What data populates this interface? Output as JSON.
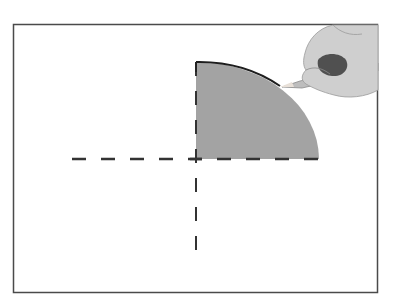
{
  "diagram": {
    "colors": {
      "background": "#ffffff",
      "frame": "#4a4a4a",
      "fill": "#a3a3a3",
      "stroke": "#222222",
      "dash": "#333333",
      "skin": "#c9c9c9",
      "skin_shadow": "#7a7a7a",
      "pencil": "#bdbdbd"
    },
    "frame": {
      "x": 13,
      "y": 24,
      "width": 365,
      "height": 269
    },
    "center": {
      "x": 196,
      "y": 159
    },
    "sector": {
      "rx": 123,
      "ry": 97,
      "start_deg": 0,
      "end_deg": 90
    },
    "axes": {
      "horizontal": {
        "x1": 72,
        "x2": 319,
        "y": 159
      },
      "vertical": {
        "x": 196,
        "y1": 62,
        "y2": 257
      }
    },
    "icons": [
      "hand-with-pencil-icon"
    ]
  }
}
